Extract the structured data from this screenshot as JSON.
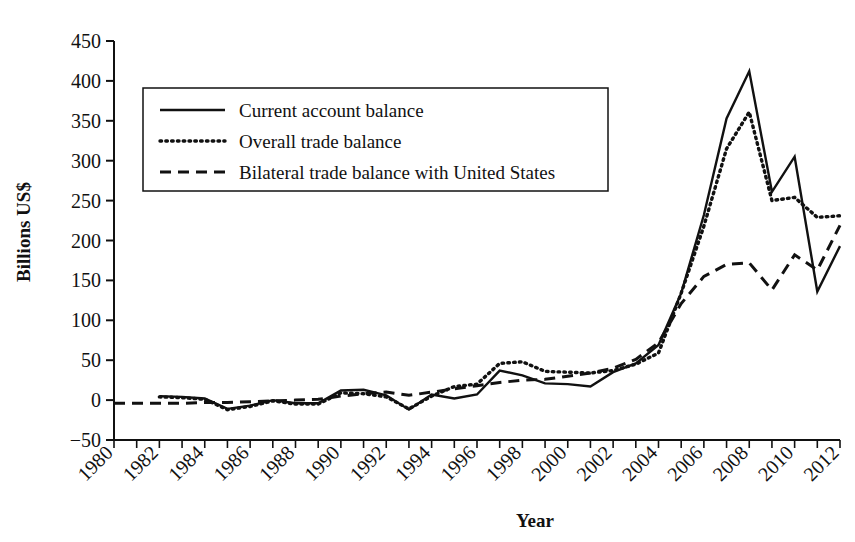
{
  "chart_data": {
    "type": "line",
    "title": "",
    "xlabel": "Year",
    "ylabel": "Billions US$",
    "xlim": [
      1980,
      2012
    ],
    "ylim": [
      -50,
      450
    ],
    "ytick_values": [
      -50,
      0,
      50,
      100,
      150,
      200,
      250,
      300,
      350,
      400,
      450
    ],
    "ytick_labels": [
      "−50",
      "0",
      "50",
      "100",
      "150",
      "200",
      "250",
      "300",
      "350",
      "400",
      "450"
    ],
    "xtick_values": [
      1980,
      1982,
      1984,
      1986,
      1988,
      1990,
      1992,
      1994,
      1996,
      1998,
      2000,
      2002,
      2004,
      2006,
      2008,
      2010,
      2012
    ],
    "xtick_labels": [
      "1980",
      "1982",
      "1984",
      "1986",
      "1988",
      "1990",
      "1992",
      "1994",
      "1996",
      "1998",
      "2000",
      "2002",
      "2004",
      "2006",
      "2008",
      "2010",
      "2012"
    ],
    "x_minor_step": 1,
    "grid": false,
    "legend_position": "upper-left",
    "series": [
      {
        "name": "Current account balance",
        "style": "solid",
        "color": "#111111",
        "x": [
          1982,
          1983,
          1984,
          1985,
          1986,
          1987,
          1988,
          1989,
          1990,
          1991,
          1992,
          1993,
          1994,
          1995,
          1996,
          1997,
          1998,
          1999,
          2000,
          2001,
          2002,
          2003,
          2004,
          2005,
          2006,
          2007,
          2008,
          2009,
          2010,
          2011,
          2012
        ],
        "values": [
          5,
          4,
          2,
          -11,
          -7,
          0,
          -4,
          -4,
          12,
          13,
          6,
          -12,
          7,
          2,
          7,
          37,
          31,
          21,
          20,
          17,
          35,
          46,
          69,
          134,
          232,
          353,
          412,
          261,
          305,
          136,
          193
        ]
      },
      {
        "name": "Overall trade balance",
        "style": "dotted",
        "color": "#111111",
        "x": [
          1982,
          1983,
          1984,
          1985,
          1986,
          1987,
          1988,
          1989,
          1990,
          1991,
          1992,
          1993,
          1994,
          1995,
          1996,
          1997,
          1998,
          1999,
          2000,
          2001,
          2002,
          2003,
          2004,
          2005,
          2006,
          2007,
          2008,
          2009,
          2010,
          2011,
          2012
        ],
        "values": [
          4,
          3,
          1,
          -12,
          -8,
          -1,
          -5,
          -5,
          9,
          8,
          4,
          -11,
          5,
          17,
          20,
          46,
          48,
          36,
          35,
          34,
          37,
          45,
          59,
          134,
          218,
          315,
          361,
          250,
          254,
          229,
          231
        ]
      },
      {
        "name": "Bilateral trade balance with United States",
        "style": "dashed",
        "color": "#111111",
        "x": [
          1980,
          1981,
          1982,
          1983,
          1984,
          1985,
          1986,
          1987,
          1988,
          1989,
          1990,
          1991,
          1992,
          1993,
          1994,
          1995,
          1996,
          1997,
          1998,
          1999,
          2000,
          2001,
          2002,
          2003,
          2004,
          2005,
          2006,
          2007,
          2008,
          2009,
          2010,
          2011,
          2012
        ],
        "values": [
          -4,
          -4,
          -4,
          -4,
          -3,
          -3,
          -2,
          -1,
          0,
          1,
          5,
          8,
          10,
          6,
          10,
          14,
          18,
          22,
          25,
          26,
          30,
          34,
          40,
          51,
          72,
          121,
          155,
          170,
          172,
          138,
          182,
          163,
          219
        ]
      }
    ]
  },
  "legend": {
    "items": [
      {
        "label": "Current account balance",
        "style": "solid"
      },
      {
        "label": "Overall trade balance",
        "style": "dotted"
      },
      {
        "label": "Bilateral trade balance with United States",
        "style": "dashed"
      }
    ]
  },
  "axes": {
    "y_axis_title": "Billions US$",
    "x_axis_title": "Year"
  }
}
